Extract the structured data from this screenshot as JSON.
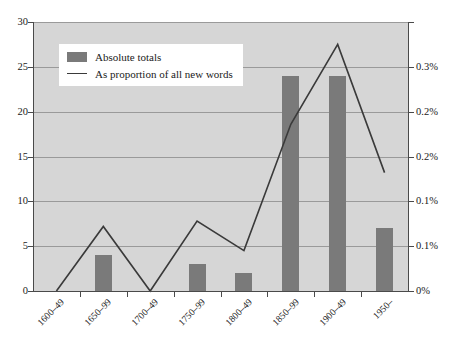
{
  "chart_data": {
    "type": "bar",
    "title": "",
    "subtitle": "",
    "xlabel": "",
    "ylabel": "",
    "categories": [
      "1600–49",
      "1650–99",
      "1700–49",
      "1750–99",
      "1800–49",
      "1850–99",
      "1900–49",
      "1950–"
    ],
    "grid": true,
    "legend_position": "top-left",
    "series": [
      {
        "name": "Absolute totals",
        "type": "bar",
        "axis": "left",
        "color": "#7a7a7a",
        "values": [
          0,
          4,
          0,
          3,
          2,
          24,
          24,
          7
        ]
      },
      {
        "name": "As proportion of all new words",
        "type": "line",
        "axis": "right",
        "color": "#3a3a3a",
        "values": [
          0,
          0.072,
          0,
          0.078,
          0.045,
          0.186,
          0.275,
          0.132
        ],
        "unit": "%"
      }
    ],
    "axes": {
      "left": {
        "label": "",
        "ylim": [
          0,
          30
        ],
        "ticks": [
          0,
          5,
          10,
          15,
          20,
          25,
          30
        ],
        "tick_labels": [
          "0",
          "5",
          "10",
          "15",
          "20",
          "25",
          "30"
        ]
      },
      "right": {
        "label": "",
        "ylim": [
          0,
          0.3
        ],
        "ticks": [
          0,
          0.05,
          0.1,
          0.15,
          0.2,
          0.25,
          0.3
        ],
        "tick_labels": [
          "0%",
          "0.1%",
          "0.1%",
          "0.2%",
          "0.2%",
          "0.3%"
        ],
        "tick_values_labeled": [
          0,
          0.05,
          0.1,
          0.15,
          0.2,
          0.25,
          0.3
        ]
      }
    },
    "colors": {
      "plot_background": "#d6d6d6",
      "bar": "#7a7a7a",
      "line": "#3a3a3a",
      "gridline": "#9a9a9a",
      "axis": "#4a4a4a",
      "legend_background": "#ffffff"
    }
  },
  "legend": {
    "items": [
      {
        "label": "Absolute totals",
        "swatch": "bar-swatch"
      },
      {
        "label": "As proportion of all new words",
        "swatch": "line-swatch"
      }
    ]
  }
}
